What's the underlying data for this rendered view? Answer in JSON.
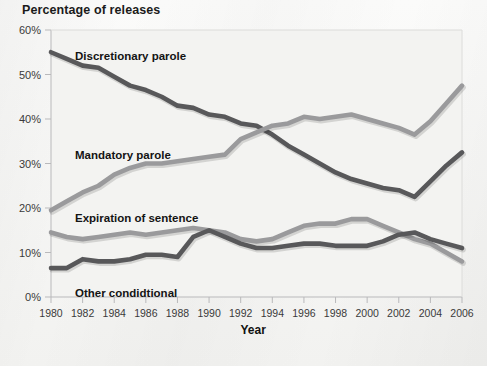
{
  "title": "Percentage of releases",
  "axis": {
    "x_title": "Year",
    "y_ticks": [
      "0%",
      "10%",
      "20%",
      "30%",
      "40%",
      "50%",
      "60%"
    ],
    "x_ticks": [
      "1980",
      "1982",
      "1984",
      "1986",
      "1988",
      "1990",
      "1992",
      "1994",
      "1996",
      "1998",
      "2000",
      "2002",
      "2004",
      "2006"
    ]
  },
  "series_labels": {
    "discretionary": "Discretionary parole",
    "mandatory": "Mandatory parole",
    "expiration": "Expiration of sentence",
    "other": "Other condidtional"
  },
  "colors": {
    "dark": "#58585a",
    "medium": "#9a9a9c",
    "axis": "#b9b9bb",
    "background": "#f7f7f5"
  },
  "chart_data": {
    "type": "line",
    "title": "Percentage of releases",
    "xlabel": "Year",
    "ylabel": "Percentage of releases",
    "xlim": [
      1980,
      2006
    ],
    "ylim": [
      0,
      60
    ],
    "grid": false,
    "legend": "inline-labels",
    "x": [
      1980,
      1981,
      1982,
      1983,
      1984,
      1985,
      1986,
      1987,
      1988,
      1989,
      1990,
      1991,
      1992,
      1993,
      1994,
      1995,
      1996,
      1997,
      1998,
      1999,
      2000,
      2001,
      2002,
      2003,
      2004,
      2005,
      2006
    ],
    "series": [
      {
        "name": "Discretionary parole",
        "color": "#58585a",
        "values": [
          55.0,
          53.5,
          52.0,
          51.5,
          49.5,
          47.5,
          46.5,
          45.0,
          43.0,
          42.5,
          41.0,
          40.5,
          39.0,
          38.5,
          36.5,
          34.0,
          32.0,
          30.0,
          28.0,
          26.5,
          25.5,
          24.5,
          24.0,
          22.5,
          26.0,
          29.5,
          32.5
        ]
      },
      {
        "name": "Mandatory parole",
        "color": "#9a9a9c",
        "values": [
          19.5,
          21.5,
          23.5,
          25.0,
          27.5,
          29.0,
          30.0,
          30.0,
          30.5,
          31.0,
          31.5,
          32.0,
          35.5,
          37.0,
          38.5,
          39.0,
          40.5,
          40.0,
          40.5,
          41.0,
          40.0,
          39.0,
          38.0,
          36.5,
          39.5,
          43.5,
          47.5
        ]
      },
      {
        "name": "Expiration of sentence",
        "color": "#9a9a9c",
        "values": [
          14.5,
          13.5,
          13.0,
          13.5,
          14.0,
          14.5,
          14.0,
          14.5,
          15.0,
          15.5,
          15.0,
          14.5,
          13.0,
          12.5,
          13.0,
          14.5,
          16.0,
          16.5,
          16.5,
          17.5,
          17.5,
          16.0,
          14.5,
          13.0,
          12.0,
          10.0,
          8.0
        ]
      },
      {
        "name": "Other condidtional",
        "color": "#58585a",
        "values": [
          6.5,
          6.5,
          8.5,
          8.0,
          8.0,
          8.5,
          9.5,
          9.5,
          9.0,
          13.5,
          15.0,
          13.5,
          12.0,
          11.0,
          11.0,
          11.5,
          12.0,
          12.0,
          11.5,
          11.5,
          11.5,
          12.5,
          14.0,
          14.5,
          13.0,
          12.0,
          11.0
        ]
      }
    ]
  }
}
